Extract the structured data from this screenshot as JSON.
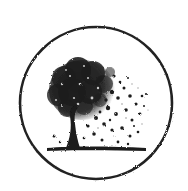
{
  "image": {
    "description": "Circular emblem with a tree whose leaves scatter to the right",
    "icon": "tree-in-circle-icon",
    "colors": {
      "background": "#ffffff",
      "ink": "#1e1e1e",
      "ring": "#222222"
    },
    "ring": {
      "cx": 96,
      "cy": 103,
      "r": 76,
      "stroke_width": 2.6
    }
  }
}
